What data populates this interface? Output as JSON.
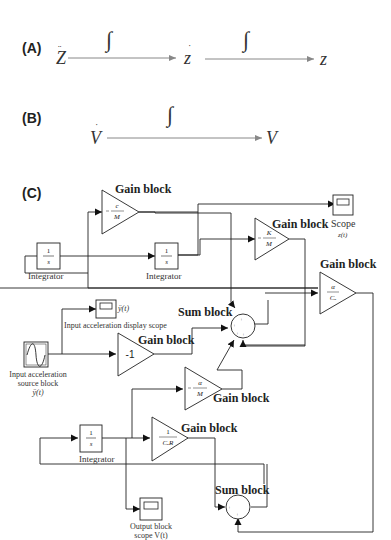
{
  "panels": {
    "A": {
      "label": "(A)",
      "z_ddot": "Z",
      "z_dot": "z",
      "z": "z",
      "integral1": "∫",
      "integral2": "∫"
    },
    "B": {
      "label": "(B)",
      "v_dot": "V",
      "v": "V",
      "integral": "∫"
    },
    "C": {
      "label": "(C)",
      "gain_c_m": {
        "title": "Gain block",
        "value": "-c/M"
      },
      "gain_k_m": {
        "title": "Gain block",
        "value": "-K/M"
      },
      "gain_alpha_ce": {
        "title": "Gain block",
        "value": "α/Cₑ"
      },
      "gain_neg1": {
        "title": "Gain block",
        "value": "-1"
      },
      "gain_alpha_m": {
        "title": "Gain block",
        "value": "-α/M"
      },
      "gain_1_cer": {
        "title": "Gain block",
        "value": "-1/CₑR"
      },
      "integrator1": {
        "label": "Integrator",
        "value": "1/s"
      },
      "integrator2": {
        "label": "Integrator",
        "value": "1/s"
      },
      "integrator3": {
        "label": "Integrator",
        "value": "1/s"
      },
      "scope_z": {
        "label": "Scope",
        "sub": "z(t)"
      },
      "scope_input": {
        "label": "Input acceleration display scope",
        "sub": "ÿ(t)"
      },
      "source": {
        "label1": "Input acceleration",
        "label2": "source block",
        "sub": "ÿ(t)"
      },
      "sum1": {
        "title": "Sum block"
      },
      "sum2": {
        "title": "Sum block"
      },
      "scope_output": {
        "label1": "Output block",
        "label2": "scope V(t)"
      }
    }
  }
}
